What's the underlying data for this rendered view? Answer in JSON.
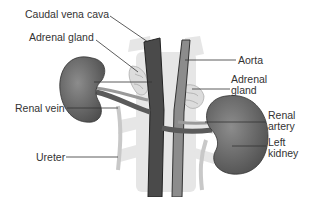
{
  "diagram": {
    "labels": {
      "caudal_vena_cava": "Caudal vena cava",
      "adrenal_gland_left": "Adrenal gland",
      "aorta": "Aorta",
      "adrenal_gland_right_line1": "Adrenal",
      "adrenal_gland_right_line2": "gland",
      "renal_vein": "Renal vein",
      "renal_artery_line1": "Renal",
      "renal_artery_line2": "artery",
      "left_kidney_line1": "Left",
      "left_kidney_line2": "kidney",
      "ureter": "Ureter"
    },
    "colors": {
      "kidney": "#6e6e6e",
      "vena_cava": "#4a4a4a",
      "aorta": "#8a8a8a",
      "spine": "#e2e2e2",
      "adrenal": "#d8d8d8",
      "ureter": "#cfcfcf",
      "leader_line": "#333333"
    }
  }
}
